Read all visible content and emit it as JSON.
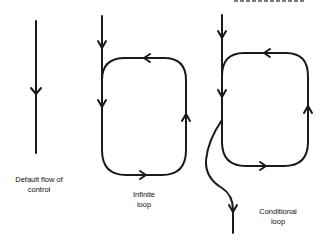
{
  "diagram": {
    "top_fragment": "cropped heading text (illegible)",
    "panels": [
      {
        "id": "default-flow",
        "label_line1": "Default flow of",
        "label_line2": "control"
      },
      {
        "id": "infinite-loop",
        "label_line1": "Infinite",
        "label_line2": "loop"
      },
      {
        "id": "conditional-loop",
        "label_line1": "Conditional",
        "label_line2": "loop"
      }
    ],
    "colors": {
      "stroke": "#1a1a1a",
      "background": "#ffffff",
      "text": "#111111"
    }
  }
}
